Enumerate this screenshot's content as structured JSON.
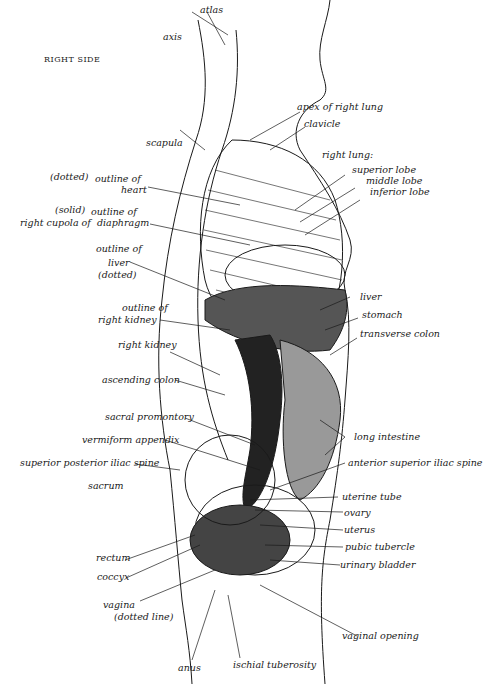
{
  "diagram": {
    "side_label": "RIGHT SIDE",
    "labels": {
      "atlas": "atlas",
      "axis": "axis",
      "apex_right_lung": "apex of right lung",
      "clavicle": "clavicle",
      "scapula": "scapula",
      "right_lung_heading": "right lung:",
      "superior_lobe": "superior lobe",
      "middle_lobe": "middle lobe",
      "inferior_lobe": "inferior lobe",
      "heart_note": "(dotted)",
      "heart_1": "outline of",
      "heart_2": "heart",
      "diaphragm_note": "(solid)",
      "diaphragm_1": "outline of",
      "diaphragm_left": "right cupola of",
      "diaphragm_2": "diaphragm",
      "liver_outline_1": "outline of",
      "liver_outline_2": "liver",
      "liver_outline_3": "(dotted)",
      "kidney_outline_1": "outline of",
      "kidney_outline_2": "right kidney",
      "right_kidney": "right kidney",
      "ascending_colon": "ascending colon",
      "sacral_promontory": "sacral promontory",
      "vermiform_appendix": "vermiform appendix",
      "sup_post_iliac_spine": "superior posterior iliac spine",
      "sacrum": "sacrum",
      "liver": "liver",
      "stomach": "stomach",
      "transverse_colon": "transverse colon",
      "long_intestine": "long intestine",
      "ant_sup_iliac_spine": "anterior superior iliac spine",
      "uterine_tube": "uterine tube",
      "ovary": "ovary",
      "uterus": "uterus",
      "pubic_tubercle": "pubic tubercle",
      "urinary_bladder": "urinary bladder",
      "rectum": "rectum",
      "coccyx": "coccyx",
      "vagina_1": "vagina",
      "vagina_2": "(dotted line)",
      "vaginal_opening": "vaginal opening",
      "anus": "anus",
      "ischial_tuberosity": "ischial tuberosity"
    },
    "vertebra_numbers": [
      "3",
      "4",
      "5",
      "6",
      "7"
    ],
    "rib_numbers": [
      "9",
      "10",
      "11",
      "12"
    ],
    "lumbar_numbers": [
      "1",
      "2",
      "3"
    ],
    "colors": {
      "ink": "#1a1a1a",
      "paper": "#ffffff"
    }
  }
}
